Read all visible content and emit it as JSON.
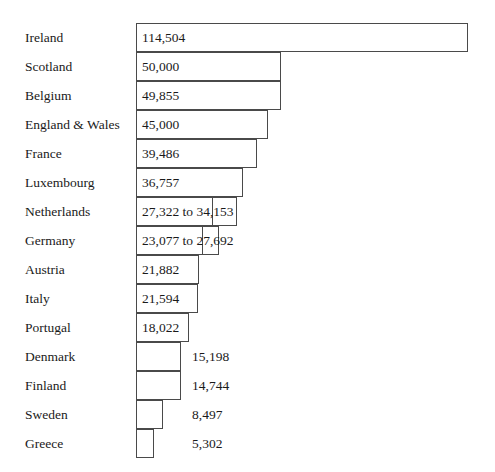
{
  "chart_data": {
    "type": "bar",
    "orientation": "horizontal",
    "title": "",
    "subtitle": "",
    "xlabel": "",
    "ylabel": "",
    "grid": false,
    "legend": null,
    "axis_visible": false,
    "xlim": [
      0,
      114504
    ],
    "categories": [
      "Ireland",
      "Scotland",
      "Belgium",
      "England & Wales",
      "France",
      "Luxembourg",
      "Netherlands",
      "Germany",
      "Austria",
      "Italy",
      "Portugal",
      "Denmark",
      "Finland",
      "Sweden",
      "Greece"
    ],
    "values": [
      114504,
      50000,
      49855,
      45000,
      39486,
      36757,
      34153,
      27692,
      21882,
      21594,
      18022,
      15198,
      14744,
      8497,
      5302
    ],
    "value_labels": [
      "114,504",
      "50,000",
      "49,855",
      "45,000",
      "39,486",
      "36,757",
      "27,322 to 34,153",
      "23,077 to 27,692",
      "21,882",
      "21,594",
      "18,022",
      "15,198",
      "14,744",
      "8,497",
      "5,302"
    ],
    "ranges": [
      null,
      null,
      null,
      null,
      null,
      null,
      [
        27322,
        34153
      ],
      [
        23077,
        27692
      ],
      null,
      null,
      null,
      null,
      null,
      null,
      null
    ],
    "bars": [
      {
        "category": "Ireland",
        "label": "114,504",
        "value": 114504,
        "low": null,
        "high": null,
        "label_position": "inside",
        "bar_px": 332,
        "inner_px": null
      },
      {
        "category": "Scotland",
        "label": "50,000",
        "value": 50000,
        "low": null,
        "high": null,
        "label_position": "inside",
        "bar_px": 145,
        "inner_px": null
      },
      {
        "category": "Belgium",
        "label": "49,855",
        "value": 49855,
        "low": null,
        "high": null,
        "label_position": "inside",
        "bar_px": 145,
        "inner_px": null
      },
      {
        "category": "England & Wales",
        "label": "45,000",
        "value": 45000,
        "low": null,
        "high": null,
        "label_position": "inside",
        "bar_px": 132,
        "inner_px": null
      },
      {
        "category": "France",
        "label": "39,486",
        "value": 39486,
        "low": null,
        "high": null,
        "label_position": "inside",
        "bar_px": 121,
        "inner_px": null
      },
      {
        "category": "Luxembourg",
        "label": "36,757",
        "value": 36757,
        "low": null,
        "high": null,
        "label_position": "inside",
        "bar_px": 107,
        "inner_px": null
      },
      {
        "category": "Netherlands",
        "label": "27,322 to 34,153",
        "value": 34153,
        "low": 27322,
        "high": 34153,
        "label_position": "inside",
        "bar_px": 101,
        "inner_px": 77
      },
      {
        "category": "Germany",
        "label": "23,077 to 27,692",
        "value": 27692,
        "low": 23077,
        "high": 27692,
        "label_position": "inside",
        "bar_px": 83,
        "inner_px": 67
      },
      {
        "category": "Austria",
        "label": "21,882",
        "value": 21882,
        "low": null,
        "high": null,
        "label_position": "inside",
        "bar_px": 63,
        "inner_px": null
      },
      {
        "category": "Italy",
        "label": "21,594",
        "value": 21594,
        "low": null,
        "high": null,
        "label_position": "inside",
        "bar_px": 62,
        "inner_px": null
      },
      {
        "category": "Portugal",
        "label": "18,022",
        "value": 18022,
        "low": null,
        "high": null,
        "label_position": "inside",
        "bar_px": 53,
        "inner_px": null
      },
      {
        "category": "Denmark",
        "label": "15,198",
        "value": 15198,
        "low": null,
        "high": null,
        "label_position": "outside",
        "bar_px": 45,
        "inner_px": null
      },
      {
        "category": "Finland",
        "label": "14,744",
        "value": 14744,
        "low": null,
        "high": null,
        "label_position": "outside",
        "bar_px": 45,
        "inner_px": null
      },
      {
        "category": "Sweden",
        "label": "8,497",
        "value": 8497,
        "low": null,
        "high": null,
        "label_position": "outside",
        "bar_px": 27,
        "inner_px": null
      },
      {
        "category": "Greece",
        "label": "5,302",
        "value": 5302,
        "low": null,
        "high": null,
        "label_position": "outside",
        "bar_px": 18,
        "inner_px": null
      }
    ],
    "colors": {
      "background": "#ffffff",
      "bar_fill": "#ffffff",
      "bar_stroke": "#4a4a4a",
      "text": "#1a1a1a"
    }
  }
}
